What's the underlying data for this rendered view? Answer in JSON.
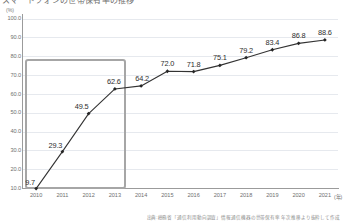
{
  "figure": {
    "title_cropped": "スマートフォンの世帯保有率の推移",
    "source_note": "出典:総務省「通信利用動向調査」情報通信機器の世帯保有率 年次推移より抜粋して作成"
  },
  "colors": {
    "line": "#333333",
    "marker": "#262626",
    "gridline": "#e6e9ee",
    "axis": "#9b9b9b",
    "highlight_border": "#a6a6a6",
    "tick_text": "#6f6f6f",
    "label_text": "#2e2e2e",
    "source_text": "#8d8d8d",
    "background": "#ffffff"
  },
  "annotations": {
    "highlight_region": {
      "label": "2010-2013 highlight box",
      "start_category": "2010",
      "end_category": "2013"
    }
  },
  "chart_data": {
    "type": "line",
    "title": "スマートフォンの世帯保有率の推移",
    "xlabel": "(年)",
    "ylabel": "(%)",
    "categories": [
      "2010",
      "2011",
      "2012",
      "2013",
      "2014",
      "2015",
      "2016",
      "2017",
      "2018",
      "2019",
      "2020",
      "2021"
    ],
    "values": [
      9.7,
      29.3,
      49.5,
      62.6,
      64.2,
      72.0,
      71.8,
      75.1,
      79.2,
      83.4,
      86.8,
      88.6
    ],
    "point_labels": [
      "9.7",
      "29.3",
      "49.5",
      "62.6",
      "64.2",
      "72.0",
      "71.8",
      "75.1",
      "79.2",
      "83.4",
      "86.8",
      "88.6"
    ],
    "ylim": [
      0,
      100
    ],
    "ytick_values": [
      100.0,
      90.0,
      80.0,
      70.0,
      60.0,
      50.0,
      40.0,
      30.0,
      20.0,
      10.0
    ],
    "ytick_labels": [
      "100.0",
      "90.0",
      "80.0",
      "70.0",
      "60.0",
      "50.0",
      "40.0",
      "30.0",
      "20.0",
      "10.0"
    ],
    "y_unit": "(%)",
    "x_unit": "(年)",
    "grid": true,
    "grid_axis": "y",
    "legend": false,
    "markers": "diamond",
    "series": [
      {
        "name": "スマートフォン世帯保有率",
        "values": [
          9.7,
          29.3,
          49.5,
          62.6,
          64.2,
          72.0,
          71.8,
          75.1,
          79.2,
          83.4,
          86.8,
          88.6
        ]
      }
    ]
  }
}
